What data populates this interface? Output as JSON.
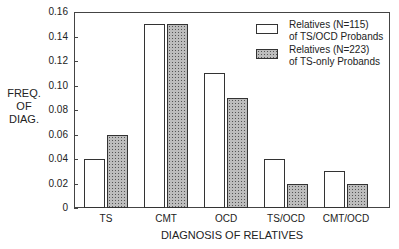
{
  "chart_data": {
    "type": "bar",
    "title": "",
    "xlabel": "DIAGNOSIS OF RELATIVES",
    "ylabel": "FREQ. OF DIAG.",
    "ylabel_lines": [
      "FREQ.",
      "OF",
      "DIAG."
    ],
    "ylim": [
      0,
      0.16
    ],
    "yticks": [
      "0",
      "0.02",
      "0.04",
      "0.06",
      "0.08",
      "0.10",
      "0.12",
      "0.14",
      "0.16"
    ],
    "categories": [
      "TS",
      "CMT",
      "OCD",
      "TS/OCD",
      "CMT/OCD"
    ],
    "series": [
      {
        "name": "Relatives (N=115) of TS/OCD Probands",
        "legend_lines": [
          "Relatives (N=115)",
          "of TS/OCD Probands"
        ],
        "style": "open",
        "values": [
          0.04,
          0.15,
          0.11,
          0.04,
          0.03
        ]
      },
      {
        "name": "Relatives (N=223) of TS-only Probands",
        "legend_lines": [
          "Relatives (N=223)",
          "of TS-only Probands"
        ],
        "style": "dotted",
        "values": [
          0.06,
          0.15,
          0.09,
          0.02,
          0.02
        ]
      }
    ],
    "grid": false,
    "legend_position": "upper right"
  }
}
